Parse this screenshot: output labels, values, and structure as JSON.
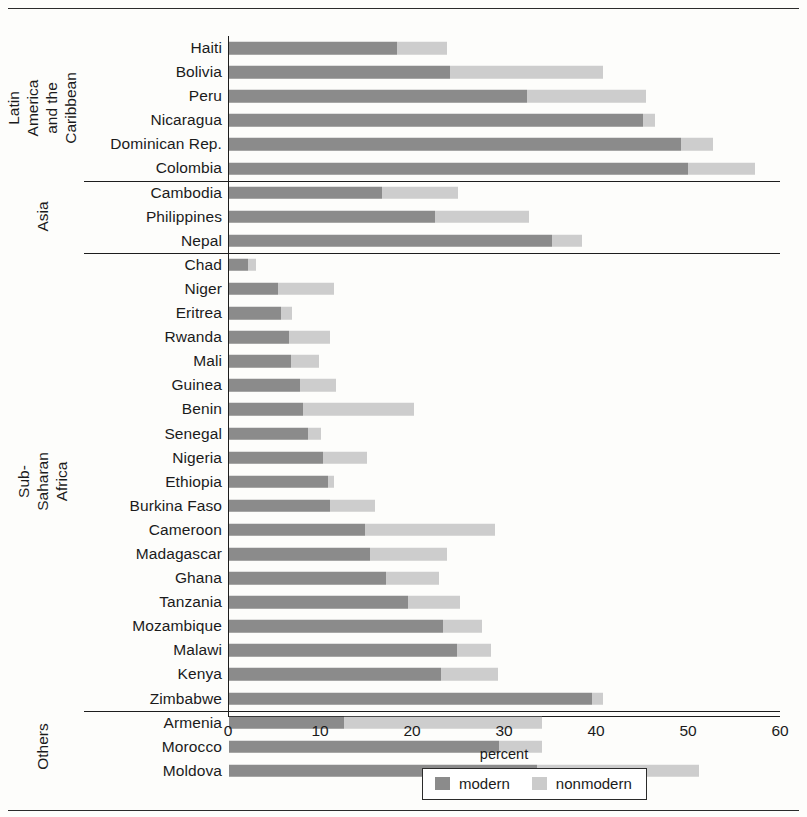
{
  "chart_data": {
    "type": "bar",
    "orientation": "horizontal",
    "stacked": true,
    "title": "",
    "xlabel": "percent",
    "ylabel": "",
    "xlim": [
      0,
      60
    ],
    "xticks": [
      0,
      10,
      20,
      30,
      40,
      50,
      60
    ],
    "grid": false,
    "legend_position": "bottom-center",
    "colors": {
      "modern": "#8b8b8b",
      "nonmodern": "#cdcdcd"
    },
    "legend": [
      "modern",
      "nonmodern"
    ],
    "series": [
      {
        "name": "modern",
        "values": [
          18.3,
          24.0,
          32.4,
          45.0,
          49.1,
          49.9,
          16.6,
          22.4,
          35.1,
          2.1,
          5.3,
          5.7,
          6.5,
          6.7,
          7.7,
          8.0,
          8.6,
          10.2,
          10.8,
          11.0,
          14.8,
          15.3,
          17.1,
          19.5,
          23.3,
          24.8,
          23.0,
          39.5,
          12.5,
          29.4,
          33.5
        ]
      },
      {
        "name": "nonmodern",
        "values": [
          5.4,
          16.7,
          12.9,
          1.3,
          3.5,
          7.3,
          8.3,
          10.2,
          3.3,
          0.8,
          6.1,
          1.1,
          4.5,
          3.1,
          3.9,
          12.1,
          1.4,
          4.8,
          0.6,
          4.9,
          14.1,
          8.4,
          5.7,
          5.6,
          4.2,
          3.7,
          6.2,
          1.2,
          21.5,
          4.6,
          17.6
        ]
      }
    ],
    "categories": [
      "Haiti",
      "Bolivia",
      "Peru",
      "Nicaragua",
      "Dominican Rep.",
      "Colombia",
      "Cambodia",
      "Philippines",
      "Nepal",
      "Chad",
      "Niger",
      "Eritrea",
      "Rwanda",
      "Mali",
      "Guinea",
      "Benin",
      "Senegal",
      "Nigeria",
      "Ethiopia",
      "Burkina Faso",
      "Cameroon",
      "Madagascar",
      "Ghana",
      "Tanzania",
      "Mozambique",
      "Malawi",
      "Kenya",
      "Zimbabwe",
      "Armenia",
      "Morocco",
      "Moldova"
    ],
    "groups": [
      {
        "label": "Latin America and the Caribbean",
        "label_lines": [
          "Latin America",
          "and the",
          "Caribbean"
        ],
        "count": 6
      },
      {
        "label": "Asia",
        "label_lines": [
          "Asia"
        ],
        "count": 3
      },
      {
        "label": "Sub-Saharan Africa",
        "label_lines": [
          "Sub-Saharan",
          "Africa"
        ],
        "count": 19
      },
      {
        "label": "Others",
        "label_lines": [
          "Others"
        ],
        "count": 3
      }
    ],
    "rows": [
      {
        "label": "Haiti",
        "modern": 18.3,
        "nonmodern": 5.4,
        "group": 0
      },
      {
        "label": "Bolivia",
        "modern": 24.0,
        "nonmodern": 16.7,
        "group": 0
      },
      {
        "label": "Peru",
        "modern": 32.4,
        "nonmodern": 12.9,
        "group": 0
      },
      {
        "label": "Nicaragua",
        "modern": 45.0,
        "nonmodern": 1.3,
        "group": 0
      },
      {
        "label": "Dominican Rep.",
        "modern": 49.1,
        "nonmodern": 3.5,
        "group": 0
      },
      {
        "label": "Colombia",
        "modern": 49.9,
        "nonmodern": 7.3,
        "group": 0
      },
      {
        "label": "Cambodia",
        "modern": 16.6,
        "nonmodern": 8.3,
        "group": 1
      },
      {
        "label": "Philippines",
        "modern": 22.4,
        "nonmodern": 10.2,
        "group": 1
      },
      {
        "label": "Nepal",
        "modern": 35.1,
        "nonmodern": 3.3,
        "group": 1
      },
      {
        "label": "Chad",
        "modern": 2.1,
        "nonmodern": 0.8,
        "group": 2
      },
      {
        "label": "Niger",
        "modern": 5.3,
        "nonmodern": 6.1,
        "group": 2
      },
      {
        "label": "Eritrea",
        "modern": 5.7,
        "nonmodern": 1.1,
        "group": 2
      },
      {
        "label": "Rwanda",
        "modern": 6.5,
        "nonmodern": 4.5,
        "group": 2
      },
      {
        "label": "Mali",
        "modern": 6.7,
        "nonmodern": 3.1,
        "group": 2
      },
      {
        "label": "Guinea",
        "modern": 7.7,
        "nonmodern": 3.9,
        "group": 2
      },
      {
        "label": "Benin",
        "modern": 8.0,
        "nonmodern": 12.1,
        "group": 2
      },
      {
        "label": "Senegal",
        "modern": 8.6,
        "nonmodern": 1.4,
        "group": 2
      },
      {
        "label": "Nigeria",
        "modern": 10.2,
        "nonmodern": 4.8,
        "group": 2
      },
      {
        "label": "Ethiopia",
        "modern": 10.8,
        "nonmodern": 0.6,
        "group": 2
      },
      {
        "label": "Burkina Faso",
        "modern": 11.0,
        "nonmodern": 4.9,
        "group": 2
      },
      {
        "label": "Cameroon",
        "modern": 14.8,
        "nonmodern": 14.1,
        "group": 2
      },
      {
        "label": "Madagascar",
        "modern": 15.3,
        "nonmodern": 8.4,
        "group": 2
      },
      {
        "label": "Ghana",
        "modern": 17.1,
        "nonmodern": 5.7,
        "group": 2
      },
      {
        "label": "Tanzania",
        "modern": 19.5,
        "nonmodern": 5.6,
        "group": 2
      },
      {
        "label": "Mozambique",
        "modern": 23.3,
        "nonmodern": 4.2,
        "group": 2
      },
      {
        "label": "Malawi",
        "modern": 24.8,
        "nonmodern": 3.7,
        "group": 2
      },
      {
        "label": "Kenya",
        "modern": 23.0,
        "nonmodern": 6.2,
        "group": 2
      },
      {
        "label": "Zimbabwe",
        "modern": 39.5,
        "nonmodern": 1.2,
        "group": 2
      },
      {
        "label": "Armenia",
        "modern": 12.5,
        "nonmodern": 21.5,
        "group": 3
      },
      {
        "label": "Morocco",
        "modern": 29.4,
        "nonmodern": 4.6,
        "group": 3
      },
      {
        "label": "Moldova",
        "modern": 33.5,
        "nonmodern": 17.6,
        "group": 3
      }
    ]
  }
}
